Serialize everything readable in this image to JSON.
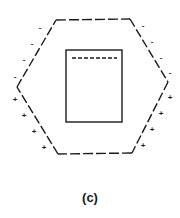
{
  "figure": {
    "caption": "(c)",
    "ink_color": "#1a1a1a",
    "charges": {
      "upper_left": [
        "-",
        "-",
        "-",
        "-"
      ],
      "lower_left": [
        "+",
        "+",
        "+",
        "+"
      ],
      "upper_right": [
        "-",
        "-",
        "-",
        "-"
      ],
      "lower_right": [
        "+",
        "+",
        "+",
        "+"
      ]
    }
  }
}
